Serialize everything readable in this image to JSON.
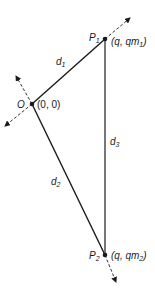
{
  "diagram": {
    "points": {
      "O": {
        "name": "O",
        "coords": "(0, 0)",
        "x": 32,
        "y": 104
      },
      "P1": {
        "name": "P",
        "sub": "1",
        "coords_prefix": "(q, qm",
        "coords_sub": "1",
        "coords_suffix": ")",
        "x": 105,
        "y": 39
      },
      "P2": {
        "name": "P",
        "sub": "2",
        "coords_prefix": "(q, qm",
        "coords_sub": "2",
        "coords_suffix": ")",
        "x": 105,
        "y": 255
      }
    },
    "edges": {
      "d1": {
        "name": "d",
        "sub": "1"
      },
      "d2": {
        "name": "d",
        "sub": "2"
      },
      "d3": {
        "name": "d",
        "sub": "3"
      }
    },
    "colors": {
      "line": "#1a1a1a",
      "dashed": "#333333"
    }
  }
}
